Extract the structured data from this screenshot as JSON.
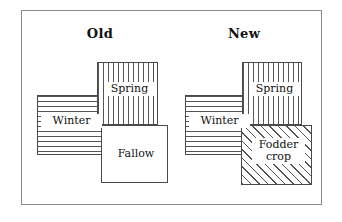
{
  "figure": {
    "title": "",
    "background_color": "#ffffff",
    "frame_color": "#8a8a8a",
    "line_color": "#4a4a4a"
  },
  "groups": [
    {
      "id": "old",
      "title": "Old",
      "blocks": [
        {
          "id": "winter-old",
          "label": "Winter",
          "pattern": "horizontal-stripes"
        },
        {
          "id": "spring-old",
          "label": "Spring",
          "pattern": "vertical-stripes"
        },
        {
          "id": "fallow-old",
          "label": "Fallow",
          "pattern": "solid-white"
        }
      ]
    },
    {
      "id": "new",
      "title": "New",
      "blocks": [
        {
          "id": "winter-new",
          "label": "Winter",
          "pattern": "horizontal-stripes"
        },
        {
          "id": "spring-new",
          "label": "Spring",
          "pattern": "vertical-stripes"
        },
        {
          "id": "fodder-new",
          "label_line1": "Fodder",
          "label_line2": "crop",
          "pattern": "diagonal-hatch"
        }
      ]
    }
  ]
}
